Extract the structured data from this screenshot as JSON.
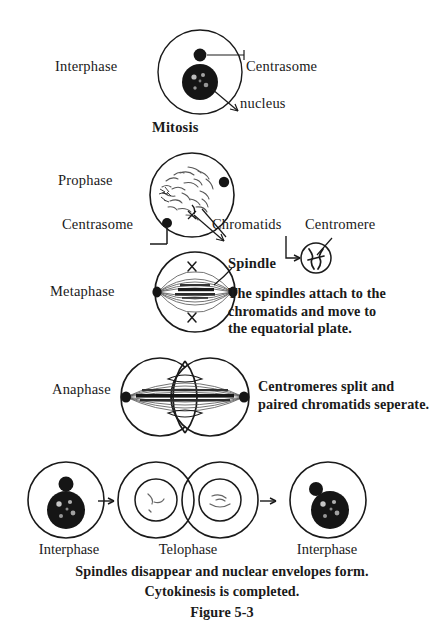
{
  "figure": {
    "title": "Figure 5-3",
    "section_heading": "Mitosis",
    "ink_color": "#1a1a1a",
    "background_color": "#ffffff"
  },
  "stages": {
    "interphase_top": {
      "phase_label": "Interphase",
      "callouts": {
        "centrosome": "Centrasome",
        "nucleus": "nucleus"
      }
    },
    "prophase": {
      "phase_label": "Prophase",
      "callouts": {
        "centrosome": "Centrasome",
        "chromatids": "Chromatids",
        "centromere": "Centromere"
      }
    },
    "metaphase": {
      "phase_label": "Metaphase",
      "callouts": {
        "spindle": "Spindle"
      },
      "description": [
        "The spindles attach to the",
        "chromatids and move to",
        "the equatorial plate."
      ]
    },
    "anaphase": {
      "phase_label": "Anaphase",
      "description": [
        "Centromeres split and",
        "paired chromatids seperate."
      ]
    },
    "bottom_row": {
      "labels": [
        "Interphase",
        "Telophase",
        "Interphase"
      ],
      "description": [
        "Spindles disappear and nuclear envelopes form.",
        "Cytokinesis is completed."
      ]
    }
  }
}
